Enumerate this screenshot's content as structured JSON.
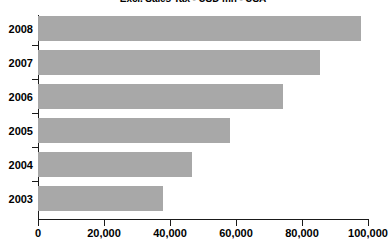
{
  "chart_data": {
    "type": "bar",
    "orientation": "horizontal",
    "title": "Excl. Sales Tax - USD mn - USA",
    "xlabel": "",
    "ylabel": "",
    "categories": [
      "2008",
      "2007",
      "2006",
      "2005",
      "2004",
      "2003"
    ],
    "values": [
      98000,
      85500,
      74200,
      58200,
      46700,
      37900
    ],
    "xlim": [
      0,
      100000
    ],
    "xticks": [
      0,
      20000,
      40000,
      60000,
      80000,
      100000
    ],
    "xtick_labels": [
      "0",
      "20,000",
      "40,000",
      "60,000",
      "80,000",
      "100,000"
    ],
    "grid": false,
    "legend": false,
    "legend_position": "none",
    "series": [
      {
        "name": "Excl. Sales Tax - USD mn - USA",
        "values": [
          98000,
          85500,
          74200,
          58200,
          46700,
          37900
        ]
      }
    ],
    "bar_color": "#a8a8a8",
    "axis_color": "#1a1a1a",
    "background_color": "#ffffff"
  }
}
